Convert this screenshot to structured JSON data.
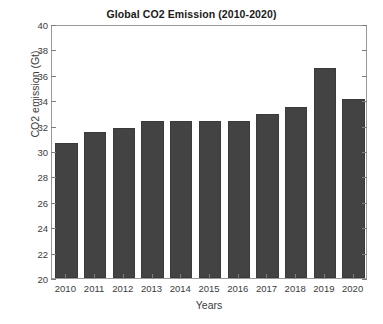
{
  "chart_data": {
    "type": "bar",
    "title": "Global CO2 Emission (2010-2020)",
    "xlabel": "Years",
    "ylabel": "CO2 emission (Gt)",
    "categories": [
      "2010",
      "2011",
      "2012",
      "2013",
      "2014",
      "2015",
      "2016",
      "2017",
      "2018",
      "2019",
      "2020"
    ],
    "values": [
      30.6,
      31.5,
      31.8,
      32.4,
      32.4,
      32.4,
      32.4,
      32.9,
      33.5,
      36.5,
      34.1
    ],
    "ylim": [
      20,
      40
    ],
    "yticks": [
      20,
      22,
      24,
      26,
      28,
      30,
      32,
      34,
      36,
      38,
      40
    ],
    "ytick_labels": [
      "20",
      "22",
      "24",
      "26",
      "28",
      "30",
      "32",
      "34",
      "36",
      "38",
      "40"
    ],
    "grid": false,
    "legend": null,
    "series_color": "#434343",
    "background": "#ffffff",
    "axis_color": "#9a9a9a"
  }
}
